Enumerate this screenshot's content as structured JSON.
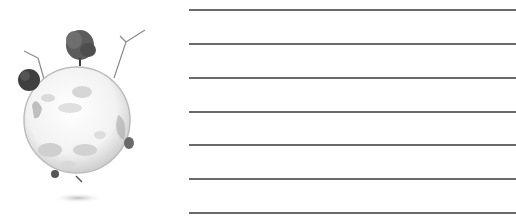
{
  "illustration": {
    "subject": "eco-globe",
    "description": "Grayscale glass globe with trees and wind turbines",
    "elements": [
      "globe",
      "tree-top",
      "tree-left",
      "tree-right",
      "wind-turbine-left",
      "wind-turbine-right",
      "ground-shadow"
    ]
  },
  "writing_lines": {
    "count": 7,
    "color": "#5a5a5a",
    "positions_y": [
      10,
      44,
      78,
      112,
      145,
      179,
      213
    ]
  }
}
